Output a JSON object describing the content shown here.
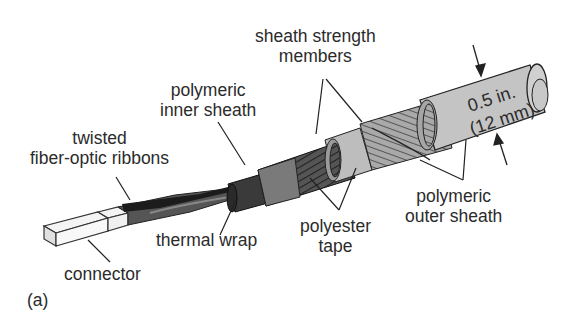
{
  "figure": {
    "panel_label": "(a)",
    "labels": {
      "sheath_strength_members": [
        "sheath strength",
        "members"
      ],
      "polymeric_inner_sheath": [
        "polymeric",
        "inner sheath"
      ],
      "twisted_ribbons": [
        "twisted",
        "fiber-optic ribbons"
      ],
      "thermal_wrap": "thermal wrap",
      "connector": "connector",
      "polyester_tape": [
        "polyester",
        "tape"
      ],
      "polymeric_outer_sheath": [
        "polymeric",
        "outer sheath"
      ]
    },
    "dimension": {
      "line1": "0.5 in.",
      "line2": "(12 mm)"
    }
  }
}
